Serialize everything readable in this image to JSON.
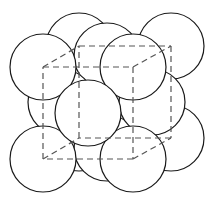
{
  "diagram": {
    "title": "",
    "stroke_color": "#1a1a1a",
    "edge_color": "#555555",
    "sphere_radius": 33,
    "cube": {
      "front": [
        [
          43,
          67
        ],
        [
          133,
          67
        ],
        [
          133,
          159
        ],
        [
          43,
          159
        ]
      ],
      "back": [
        [
          79,
          46
        ],
        [
          171,
          46
        ],
        [
          171,
          138
        ],
        [
          79,
          138
        ]
      ]
    },
    "spheres": [
      {
        "name": "back-top-left-corner",
        "cx": 79,
        "cy": 46
      },
      {
        "name": "back-top-right-corner",
        "cx": 171,
        "cy": 46
      },
      {
        "name": "back-bottom-left-corner",
        "cx": 79,
        "cy": 138
      },
      {
        "name": "back-bottom-right-corner",
        "cx": 171,
        "cy": 138
      },
      {
        "name": "back-face-center",
        "cx": 125,
        "cy": 92
      },
      {
        "name": "top-face-center",
        "cx": 107,
        "cy": 56
      },
      {
        "name": "bottom-face-center",
        "cx": 107,
        "cy": 148
      },
      {
        "name": "left-face-center",
        "cx": 61,
        "cy": 102
      },
      {
        "name": "right-face-center",
        "cx": 152,
        "cy": 102
      },
      {
        "name": "front-top-left-corner",
        "cx": 43,
        "cy": 67
      },
      {
        "name": "front-top-right-corner",
        "cx": 133,
        "cy": 67
      },
      {
        "name": "front-bottom-left-corner",
        "cx": 43,
        "cy": 159
      },
      {
        "name": "front-bottom-right-corner",
        "cx": 133,
        "cy": 159
      },
      {
        "name": "front-face-center",
        "cx": 88,
        "cy": 113
      }
    ]
  }
}
